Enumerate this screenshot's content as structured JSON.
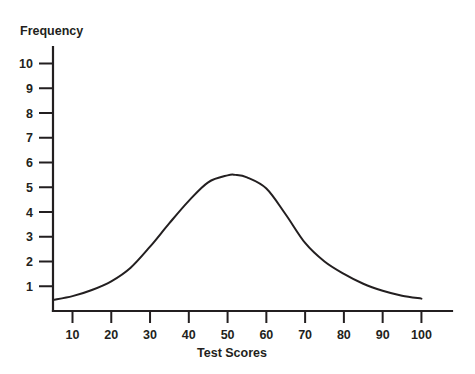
{
  "chart_data": {
    "type": "line",
    "title": "",
    "subtitle": "",
    "xlabel": "Test Scores",
    "ylabel": "Frequency",
    "xlim": [
      5,
      110
    ],
    "ylim": [
      0,
      10.6
    ],
    "grid": false,
    "legend": null,
    "x_ticks": [
      10,
      20,
      30,
      40,
      50,
      60,
      70,
      80,
      90,
      100
    ],
    "x_tick_labels": [
      "10",
      "20",
      "30",
      "40",
      "50",
      "60",
      "70",
      "80",
      "90",
      "100"
    ],
    "y_ticks": [
      1,
      2,
      3,
      4,
      5,
      6,
      7,
      8,
      9,
      10
    ],
    "y_tick_labels": [
      "1",
      "2",
      "3",
      "4",
      "5",
      "6",
      "7",
      "8",
      "9",
      "10"
    ],
    "curve_color": "#231f20",
    "axis_color": "#231f20",
    "background_color": "#ffffff",
    "series": [
      {
        "name": "Frequency distribution",
        "x": [
          5,
          10,
          15,
          20,
          25,
          30,
          35,
          40,
          45,
          50,
          52,
          55,
          60,
          65,
          70,
          75,
          80,
          85,
          90,
          95,
          100
        ],
        "values": [
          0.45,
          0.6,
          0.85,
          1.2,
          1.75,
          2.6,
          3.55,
          4.45,
          5.2,
          5.48,
          5.5,
          5.4,
          4.95,
          3.9,
          2.75,
          2.0,
          1.5,
          1.1,
          0.82,
          0.62,
          0.5
        ]
      }
    ],
    "peak": {
      "x": 52,
      "y": 5.5
    },
    "annotations": []
  },
  "axis_titles": {
    "y": "Frequency",
    "x": "Test Scores"
  }
}
